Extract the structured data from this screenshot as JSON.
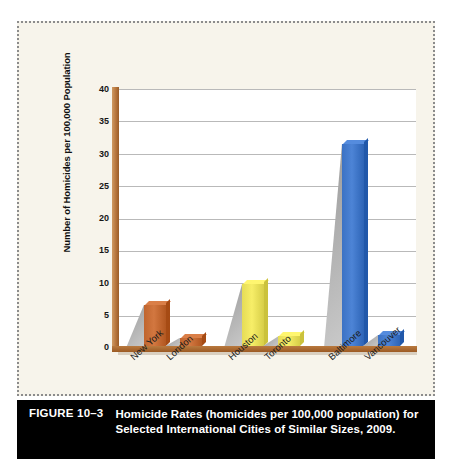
{
  "figure": {
    "number_label": "FIGURE 10–3",
    "caption": "Homicide Rates (homicides per 100,000 population) for Selected International Cities of Similar Sizes, 2009."
  },
  "colors": {
    "brown": "#C0652E",
    "yellow": "#E5DC56",
    "blue": "#3B72C4",
    "axis_brown": "#9C5A24",
    "grid": "#B9B9B9",
    "canvas": "#F7F4EB",
    "plot": "#FFFFFF",
    "caption_bg": "#000000"
  },
  "chart_data": {
    "type": "bar",
    "title": "",
    "xlabel": "",
    "ylabel": "Number of Homicides per 100,000 Population",
    "ylim": [
      0,
      40
    ],
    "yticks": [
      0,
      5,
      10,
      15,
      20,
      25,
      30,
      35,
      40
    ],
    "grid": true,
    "legend": "none",
    "categories": [
      "New York",
      "London",
      "Houston",
      "Toronto",
      "Baltimore",
      "Vancouver"
    ],
    "values": [
      6.7,
      1.6,
      9.9,
      1.8,
      31.7,
      2.0
    ],
    "bar_colors": [
      "#C0652E",
      "#C0652E",
      "#E5DC56",
      "#E5DC56",
      "#3B72C4",
      "#3B72C4"
    ],
    "groups": [
      {
        "pair": [
          "New York",
          "London"
        ],
        "color": "#C0652E"
      },
      {
        "pair": [
          "Houston",
          "Toronto"
        ],
        "color": "#E5DC56"
      },
      {
        "pair": [
          "Baltimore",
          "Vancouver"
        ],
        "color": "#3B72C4"
      }
    ]
  }
}
